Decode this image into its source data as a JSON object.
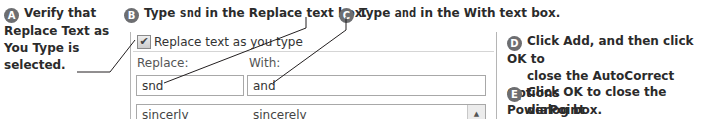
{
  "steps": [
    {
      "letter": "A",
      "parts": [
        "Verify that",
        "Replace Text as",
        "You Type",
        " is",
        "selected."
      ]
    },
    {
      "letter": "B",
      "pre": "Type ",
      "code": "snd",
      "mid": " in the ",
      "bold": "Replace",
      "post": " text box."
    },
    {
      "letter": "C",
      "pre": "Type ",
      "code": "and",
      "mid": " in the ",
      "bold": "With",
      "post": " text box."
    },
    {
      "letter": "D",
      "pre": "Click ",
      "bold1": "Add",
      "mid": ", and then click ",
      "bold2": "OK",
      "post": " to",
      "line2": "close the AutoCorrect Options",
      "line3": "dialog box."
    },
    {
      "letter": "E",
      "pre": "Click ",
      "bold": "OK",
      "post": " to close the PowerPoint",
      "line2": "Options dialog box."
    }
  ],
  "dialog": {
    "checkbox_label": "Replace text as you type",
    "checkbox_mark": "✔",
    "replace_label": "Replace:",
    "with_label": "With:",
    "replace_value": "snd",
    "with_value": "and",
    "list_row": {
      "replace": "sincerly",
      "with": "sincerely"
    },
    "scroll_up_glyph": "▲"
  },
  "colors": {
    "badge": "#6d6e71",
    "border": "#a8a8a8",
    "text": "#231f20"
  }
}
